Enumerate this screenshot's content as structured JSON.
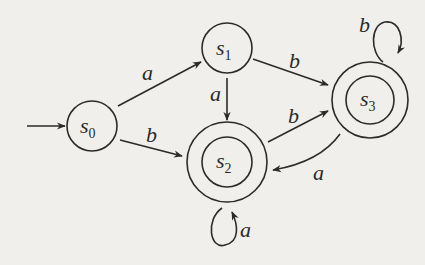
{
  "diagram": {
    "type": "finite-state-automaton",
    "start_state": "s0",
    "states": [
      {
        "id": "s0",
        "name": "s",
        "sub": "0",
        "accepting": false
      },
      {
        "id": "s1",
        "name": "s",
        "sub": "1",
        "accepting": false
      },
      {
        "id": "s2",
        "name": "s",
        "sub": "2",
        "accepting": true
      },
      {
        "id": "s3",
        "name": "s",
        "sub": "3",
        "accepting": true
      }
    ],
    "transitions": [
      {
        "from": "s0",
        "to": "s1",
        "label": "a"
      },
      {
        "from": "s0",
        "to": "s2",
        "label": "b"
      },
      {
        "from": "s1",
        "to": "s2",
        "label": "a"
      },
      {
        "from": "s1",
        "to": "s3",
        "label": "b"
      },
      {
        "from": "s2",
        "to": "s3",
        "label": "b"
      },
      {
        "from": "s3",
        "to": "s2",
        "label": "a"
      },
      {
        "from": "s2",
        "to": "s2",
        "label": "a"
      },
      {
        "from": "s3",
        "to": "s3",
        "label": "b"
      }
    ]
  }
}
